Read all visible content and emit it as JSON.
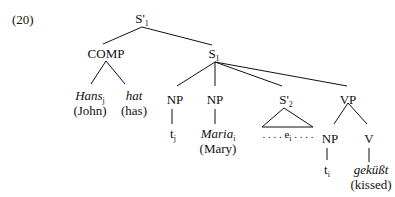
{
  "example_number": "(20)",
  "nodes": {
    "root": {
      "label": "S'",
      "sub": "1"
    },
    "comp": {
      "label": "COMP"
    },
    "s1": {
      "label": "S",
      "sub": "1"
    },
    "hans": {
      "label": "Hans",
      "sub": "j",
      "gloss": "(John)"
    },
    "hat": {
      "label": "hat",
      "gloss": "(has)"
    },
    "np1": {
      "label": "NP"
    },
    "t_j": {
      "label": "t",
      "sub": "j"
    },
    "np2": {
      "label": "NP"
    },
    "maria": {
      "label": "Maria",
      "sub": "i",
      "gloss": "(Mary)"
    },
    "s2": {
      "label": "S'",
      "sub": "2"
    },
    "e_i": {
      "label": "e",
      "sub": "i",
      "dots": ". . . ."
    },
    "vp": {
      "label": "VP"
    },
    "np3": {
      "label": "NP"
    },
    "t_i": {
      "label": "t",
      "sub": "i"
    },
    "v": {
      "label": "V"
    },
    "gekusst": {
      "label": "geküßt",
      "gloss": "(kissed)"
    }
  }
}
